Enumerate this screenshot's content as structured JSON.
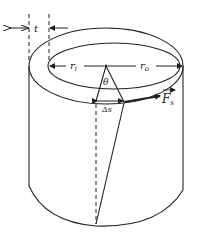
{
  "diagram": {
    "labels": {
      "thickness": "t",
      "inner_radius": "r",
      "inner_radius_sub": "i",
      "outer_radius": "r",
      "outer_radius_sub": "o",
      "angle": "θ",
      "arc_length": "Δs",
      "force": "F",
      "force_sub": "s"
    },
    "colors": {
      "stroke": "#222222",
      "background": "#ffffff"
    }
  }
}
